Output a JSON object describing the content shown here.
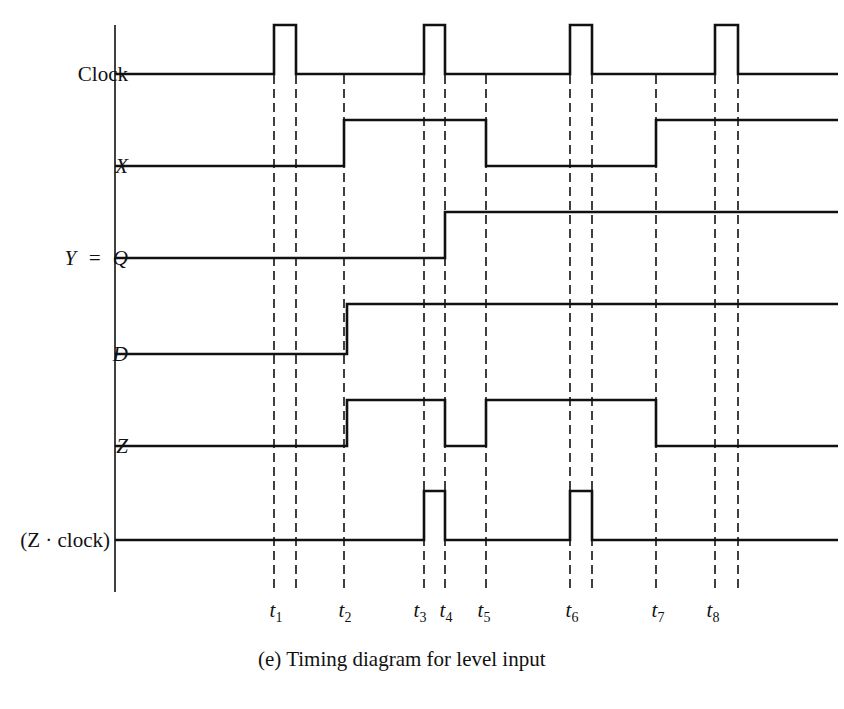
{
  "diagram": {
    "type": "timing",
    "caption": "(e)  Timing diagram for level input",
    "signals": [
      {
        "name": "Clock",
        "italic": false,
        "low_y": 74,
        "high_y": 25,
        "edges": [
          [
            274,
            296
          ],
          [
            424,
            445
          ],
          [
            570,
            592
          ],
          [
            715,
            738
          ]
        ],
        "initial": 0
      },
      {
        "name": "X",
        "italic": true,
        "low_y": 166,
        "high_y": 120,
        "edges": [
          [
            344,
            486
          ],
          [
            656,
            838
          ]
        ],
        "initial": 0
      },
      {
        "name": "Y = Q",
        "italic": true,
        "low_y": 258,
        "high_y": 212,
        "edges": [
          [
            445,
            838
          ]
        ],
        "initial": 0
      },
      {
        "name": "D",
        "italic": true,
        "low_y": 354,
        "high_y": 304,
        "edges": [
          [
            347,
            838
          ]
        ],
        "initial": 0
      },
      {
        "name": "Z",
        "italic": true,
        "low_y": 446,
        "high_y": 400,
        "edges": [
          [
            347,
            445
          ],
          [
            486,
            656
          ]
        ],
        "initial": 0
      },
      {
        "name": "(Z · clock)",
        "italic": false,
        "low_y": 540,
        "high_y": 491,
        "edges": [
          [
            424,
            445
          ],
          [
            570,
            592
          ]
        ],
        "initial": 0
      }
    ],
    "dashed_lines_x": [
      274,
      296,
      344,
      424,
      445,
      486,
      570,
      592,
      656,
      715,
      738
    ],
    "time_markers": [
      {
        "label": "t",
        "sub": "1",
        "x": 276
      },
      {
        "label": "t",
        "sub": "2",
        "x": 345
      },
      {
        "label": "t",
        "sub": "3",
        "x": 420
      },
      {
        "label": "t",
        "sub": "4",
        "x": 446
      },
      {
        "label": "t",
        "sub": "5",
        "x": 484
      },
      {
        "label": "t",
        "sub": "6",
        "x": 572
      },
      {
        "label": "t",
        "sub": "7",
        "x": 658
      },
      {
        "label": "t",
        "sub": "8",
        "x": 713
      }
    ],
    "axis": {
      "x": 115,
      "y_top": 25,
      "y_bottom": 592,
      "x_end": 838
    },
    "line_color": "#111111"
  }
}
